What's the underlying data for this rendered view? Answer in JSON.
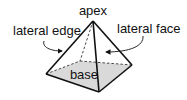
{
  "diagram": {
    "labels": {
      "apex": "apex",
      "lateral_edge": "lateral edge",
      "lateral_face": "lateral face",
      "base": "base"
    },
    "colors": {
      "stroke": "#111111",
      "base_fill": "#d9d9d9",
      "background": "#ffffff"
    }
  }
}
